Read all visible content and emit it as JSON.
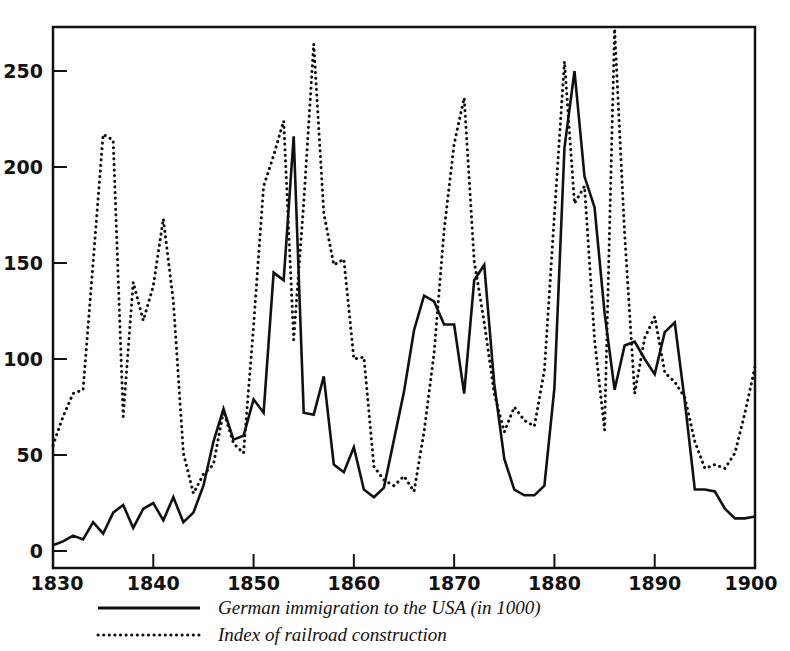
{
  "chart_data": {
    "type": "line",
    "title": "",
    "subtitle": "",
    "xlabel": "",
    "ylabel": "",
    "xlim": [
      1830,
      1900
    ],
    "ylim": [
      0,
      270
    ],
    "grid": false,
    "legend_position": "below-left",
    "x_ticks": [
      "1830",
      "1840",
      "1850",
      "1860",
      "1870",
      "1880",
      "1890",
      "1900"
    ],
    "x_tick_values": [
      1830,
      1840,
      1850,
      1860,
      1870,
      1880,
      1890,
      1900
    ],
    "y_ticks": [
      "0",
      "50",
      "100",
      "150",
      "200",
      "250"
    ],
    "y_tick_values": [
      0,
      50,
      100,
      150,
      200,
      250
    ],
    "x": [
      1830,
      1831,
      1832,
      1833,
      1834,
      1835,
      1836,
      1837,
      1838,
      1839,
      1840,
      1841,
      1842,
      1843,
      1844,
      1845,
      1846,
      1847,
      1848,
      1849,
      1850,
      1851,
      1852,
      1853,
      1854,
      1855,
      1856,
      1857,
      1858,
      1859,
      1860,
      1861,
      1862,
      1863,
      1864,
      1865,
      1866,
      1867,
      1868,
      1869,
      1870,
      1871,
      1872,
      1873,
      1874,
      1875,
      1876,
      1877,
      1878,
      1879,
      1880,
      1881,
      1882,
      1883,
      1884,
      1885,
      1886,
      1887,
      1888,
      1889,
      1890,
      1891,
      1892,
      1893,
      1894,
      1895,
      1896,
      1897,
      1898,
      1899,
      1900
    ],
    "series": [
      {
        "name": "German immigration to the USA (in 1000)",
        "style": "solid",
        "color": "#111111",
        "values": [
          3,
          5,
          8,
          6,
          15,
          9,
          20,
          24,
          12,
          22,
          25,
          16,
          28,
          15,
          20,
          34,
          57,
          74,
          58,
          60,
          79,
          72,
          145,
          141,
          216,
          72,
          71,
          91,
          45,
          41,
          54,
          32,
          28,
          33,
          58,
          83,
          115,
          133,
          130,
          118,
          118,
          82,
          141,
          149,
          87,
          48,
          32,
          29,
          29,
          34,
          85,
          210,
          250,
          195,
          179,
          124,
          84,
          107,
          109,
          100,
          92,
          114,
          119,
          78,
          32,
          32,
          31,
          22,
          17,
          17,
          18
        ]
      },
      {
        "name": "Index of railroad construction",
        "style": "dotted",
        "color": "#111111",
        "values": [
          55,
          70,
          82,
          84,
          150,
          217,
          214,
          70,
          140,
          120,
          138,
          173,
          130,
          51,
          30,
          40,
          45,
          73,
          56,
          51,
          117,
          190,
          206,
          224,
          110,
          181,
          264,
          176,
          149,
          152,
          100,
          101,
          44,
          37,
          34,
          39,
          31,
          62,
          103,
          167,
          212,
          236,
          151,
          119,
          82,
          62,
          75,
          68,
          65,
          94,
          175,
          255,
          181,
          190,
          110,
          63,
          272,
          165,
          82,
          111,
          122,
          93,
          88,
          80,
          57,
          43,
          45,
          43,
          51,
          72,
          96
        ]
      }
    ]
  },
  "legend": {
    "items": [
      {
        "label": "German immigration to the USA (in 1000)",
        "style": "solid"
      },
      {
        "label": "Index of railroad construction",
        "style": "dotted"
      }
    ]
  }
}
